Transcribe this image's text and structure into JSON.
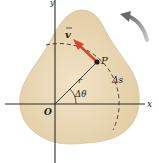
{
  "diagram": {
    "labels": {
      "x_axis": "x",
      "y_axis": "y",
      "origin": "O",
      "point": "P",
      "velocity": "v",
      "radius": "r",
      "angle": "Δθ",
      "arc": "Δs"
    },
    "colors": {
      "body_fill": "#e8d6b4",
      "body_edge": "#d9c39c",
      "velocity_arrow": "#d9452b",
      "axes": "#2a2a2a",
      "rotation_arrow": "#8a8a8a"
    },
    "rotation_direction": "counterclockwise"
  }
}
